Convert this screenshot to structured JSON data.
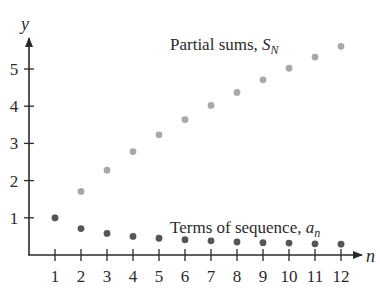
{
  "chart_data": {
    "type": "scatter",
    "title": "",
    "xlabel": "n",
    "ylabel": "y",
    "x": [
      1,
      2,
      3,
      4,
      5,
      6,
      7,
      8,
      9,
      10,
      11,
      12
    ],
    "xticks": [
      "1",
      "2",
      "3",
      "4",
      "5",
      "6",
      "7",
      "8",
      "9",
      "10",
      "11",
      "12"
    ],
    "yticks": [
      "1",
      "2",
      "3",
      "4",
      "5"
    ],
    "xlim": [
      0,
      12.8
    ],
    "ylim": [
      0,
      6
    ],
    "grid": false,
    "legend": "none (inline annotations)",
    "series": [
      {
        "name": "Partial sums, S_N",
        "label_main": "Partial sums, ",
        "label_sym": "S",
        "label_sub": "N",
        "color": "#a8a8a8",
        "values": [
          1.0,
          1.71,
          2.28,
          2.78,
          3.23,
          3.64,
          4.02,
          4.37,
          4.71,
          5.02,
          5.32,
          5.61
        ]
      },
      {
        "name": "Terms of sequence, a_n",
        "label_main": "Terms of sequence, ",
        "label_sym": "a",
        "label_sub": "n",
        "color": "#555555",
        "values": [
          1.0,
          0.71,
          0.58,
          0.5,
          0.45,
          0.41,
          0.38,
          0.35,
          0.33,
          0.32,
          0.3,
          0.29
        ]
      }
    ]
  }
}
